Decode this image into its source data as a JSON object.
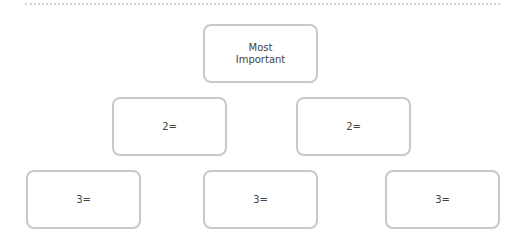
{
  "diagram": {
    "type": "ranking-pyramid",
    "levels": [
      {
        "rank": 1,
        "boxes": [
          {
            "label": "Most\nImportant"
          }
        ]
      },
      {
        "rank": 2,
        "boxes": [
          {
            "label": "2="
          },
          {
            "label": "2="
          }
        ]
      },
      {
        "rank": 3,
        "boxes": [
          {
            "label": "3="
          },
          {
            "label": "3="
          },
          {
            "label": "3="
          }
        ]
      }
    ],
    "colors": {
      "box_border": "#c9c9c9",
      "text": "#444444",
      "rule": "#d4d4d4"
    }
  }
}
